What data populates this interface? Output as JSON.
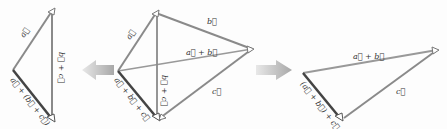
{
  "colors": {
    "line_gray": "#8a8a8a",
    "line_dark": "#444444",
    "arrow_fill": "#b5b5b5",
    "background": "#fdfdfd"
  },
  "left_diagram": {
    "labels": {
      "a": "a⃗",
      "b_plus_c": "b⃗ + c⃗",
      "result": "a⃗ + (b⃗ + c⃗)"
    }
  },
  "middle_diagram": {
    "labels": {
      "a": "a⃗",
      "b": "b⃗",
      "c": "c⃗",
      "a_plus_b": "a⃗ + b⃗",
      "b_plus_c": "b⃗ + c⃗",
      "result": "a⃗ + b⃗ + c⃗"
    }
  },
  "right_diagram": {
    "labels": {
      "a_plus_b": "a⃗ + b⃗",
      "c": "c⃗",
      "result": "(a⃗ + b⃗) + c⃗"
    }
  },
  "transitions": {
    "left_arrow": "arrow-left",
    "right_arrow": "arrow-right"
  }
}
